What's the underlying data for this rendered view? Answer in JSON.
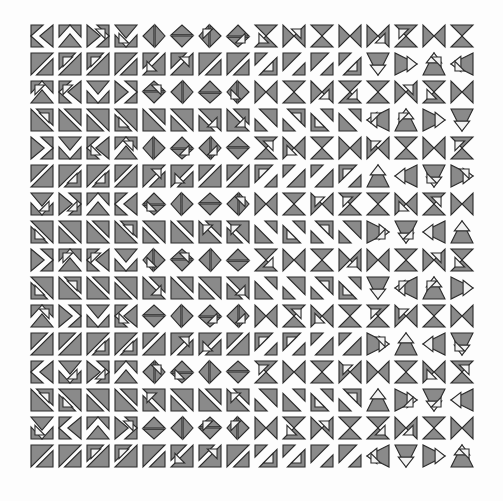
{
  "figure": {
    "kind": "symbol-grid",
    "background_color": "#fdfdfd",
    "glyph_fill_color": "#8a8a8a",
    "glyph_fill_light_color": "#f2f2f2",
    "glyph_stroke_color": "#2b2b2b",
    "rows": 16,
    "columns": 16,
    "total_glyphs": 256,
    "cell_pitch_px": 28,
    "glyph_size_px": 22,
    "grid_origin_x_px": 31,
    "grid_origin_y_px": 25
  },
  "chart_data": {
    "type": "heatmap",
    "xlabel": "",
    "ylabel": "",
    "grid": false,
    "legend_position": "none",
    "rows": 16,
    "columns": 16,
    "note": "Each cell holds one procedurally varied glyph built from gray triangles inside a square tile. Codes below describe the triangle set per cell.",
    "row_labels": [
      "r1",
      "r2",
      "r3",
      "r4",
      "r5",
      "r6",
      "r7",
      "r8",
      "r9",
      "r10",
      "r11",
      "r12",
      "r13",
      "r14",
      "r15",
      "r16"
    ],
    "column_labels": [
      "c1",
      "c2",
      "c3",
      "c4",
      "c5",
      "c6",
      "c7",
      "c8",
      "c9",
      "c10",
      "c11",
      "c12",
      "c13",
      "c14",
      "c15",
      "c16"
    ],
    "cells": [
      [
        "4-1-0",
        "4-2-1",
        "4-3-2",
        "4-0-3",
        "5-1-1",
        "5-2-0",
        "5-3-3",
        "5-0-2",
        "6-1-2",
        "6-2-3",
        "6-3-0",
        "6-0-1",
        "7-1-3",
        "7-2-2",
        "7-3-1",
        "7-0-0"
      ],
      [
        "0-1-1",
        "0-2-2",
        "0-3-3",
        "0-0-0",
        "1-1-2",
        "1-2-3",
        "1-3-0",
        "1-0-1",
        "2-1-3",
        "2-2-0",
        "2-3-1",
        "2-0-2",
        "3-1-0",
        "3-2-1",
        "3-3-2",
        "3-0-3"
      ],
      [
        "4-2-2",
        "4-3-3",
        "4-0-0",
        "4-1-1",
        "5-2-3",
        "5-3-0",
        "5-0-1",
        "5-1-2",
        "6-2-0",
        "6-3-1",
        "6-0-2",
        "6-1-3",
        "7-2-1",
        "7-3-2",
        "7-0-3",
        "7-1-0"
      ],
      [
        "0-2-3",
        "0-3-0",
        "0-0-1",
        "0-1-2",
        "1-2-0",
        "1-3-1",
        "1-0-2",
        "1-1-3",
        "2-2-1",
        "2-3-2",
        "2-0-3",
        "2-1-0",
        "3-2-2",
        "3-3-3",
        "3-0-0",
        "3-1-1"
      ],
      [
        "4-3-0",
        "4-0-1",
        "4-1-2",
        "4-2-3",
        "5-3-1",
        "5-0-2",
        "5-1-3",
        "5-2-0",
        "6-3-2",
        "6-0-3",
        "6-1-0",
        "6-2-1",
        "7-3-3",
        "7-0-0",
        "7-1-1",
        "7-2-2"
      ],
      [
        "0-3-1",
        "0-0-2",
        "0-1-3",
        "0-2-0",
        "1-3-2",
        "1-0-3",
        "1-1-0",
        "1-2-1",
        "2-3-3",
        "2-0-0",
        "2-1-1",
        "2-2-2",
        "3-3-0",
        "3-0-1",
        "3-1-2",
        "3-2-3"
      ],
      [
        "4-0-2",
        "4-1-3",
        "4-2-0",
        "4-3-1",
        "5-0-3",
        "5-1-0",
        "5-2-1",
        "5-3-2",
        "6-0-0",
        "6-1-1",
        "6-2-2",
        "6-3-3",
        "7-0-1",
        "7-1-2",
        "7-2-3",
        "7-3-0"
      ],
      [
        "0-0-3",
        "0-1-0",
        "0-2-1",
        "0-3-2",
        "1-0-0",
        "1-1-1",
        "1-2-2",
        "1-3-3",
        "2-0-1",
        "2-1-2",
        "2-2-3",
        "2-3-0",
        "3-0-2",
        "3-1-3",
        "3-2-0",
        "3-3-1"
      ],
      [
        "4-1-1",
        "4-2-2",
        "4-3-3",
        "4-0-0",
        "5-1-2",
        "5-2-3",
        "5-3-0",
        "5-0-1",
        "6-1-3",
        "6-2-0",
        "6-3-1",
        "6-0-2",
        "7-1-0",
        "7-2-1",
        "7-3-2",
        "7-0-3"
      ],
      [
        "0-1-2",
        "0-2-3",
        "0-3-0",
        "0-0-1",
        "1-1-3",
        "1-2-0",
        "1-3-1",
        "1-0-2",
        "2-1-0",
        "2-2-1",
        "2-3-2",
        "2-0-3",
        "3-1-1",
        "3-2-2",
        "3-3-3",
        "3-0-0"
      ],
      [
        "4-2-3",
        "4-3-0",
        "4-0-1",
        "4-1-2",
        "5-2-0",
        "5-3-1",
        "5-0-2",
        "5-1-3",
        "6-2-1",
        "6-3-2",
        "6-0-3",
        "6-1-0",
        "7-2-2",
        "7-3-3",
        "7-0-0",
        "7-1-1"
      ],
      [
        "0-2-0",
        "0-3-1",
        "0-0-2",
        "0-1-3",
        "1-2-1",
        "1-3-2",
        "1-0-3",
        "1-1-0",
        "2-2-2",
        "2-3-3",
        "2-0-0",
        "2-1-1",
        "3-2-3",
        "3-3-0",
        "3-0-1",
        "3-1-2"
      ],
      [
        "4-3-1",
        "4-0-2",
        "4-1-3",
        "4-2-0",
        "5-3-2",
        "5-0-3",
        "5-1-0",
        "5-2-1",
        "6-3-3",
        "6-0-0",
        "6-1-1",
        "6-2-2",
        "7-3-0",
        "7-0-1",
        "7-1-2",
        "7-2-3"
      ],
      [
        "0-3-2",
        "0-0-3",
        "0-1-0",
        "0-2-1",
        "1-3-3",
        "1-0-0",
        "1-1-1",
        "1-2-2",
        "2-3-0",
        "2-0-1",
        "2-1-2",
        "2-2-3",
        "3-3-1",
        "3-0-2",
        "3-1-3",
        "3-2-0"
      ],
      [
        "4-0-3",
        "4-1-0",
        "4-2-1",
        "4-3-2",
        "5-0-0",
        "5-1-1",
        "5-2-2",
        "5-3-3",
        "6-0-1",
        "6-1-2",
        "6-2-3",
        "6-3-0",
        "7-0-2",
        "7-1-3",
        "7-2-0",
        "7-3-1"
      ],
      [
        "0-0-0",
        "0-1-1",
        "0-2-2",
        "0-3-3",
        "1-0-1",
        "1-1-2",
        "1-2-3",
        "1-3-0",
        "2-0-2",
        "2-1-3",
        "2-2-0",
        "2-3-1",
        "3-0-3",
        "3-1-0",
        "3-2-1",
        "3-3-2"
      ]
    ]
  }
}
